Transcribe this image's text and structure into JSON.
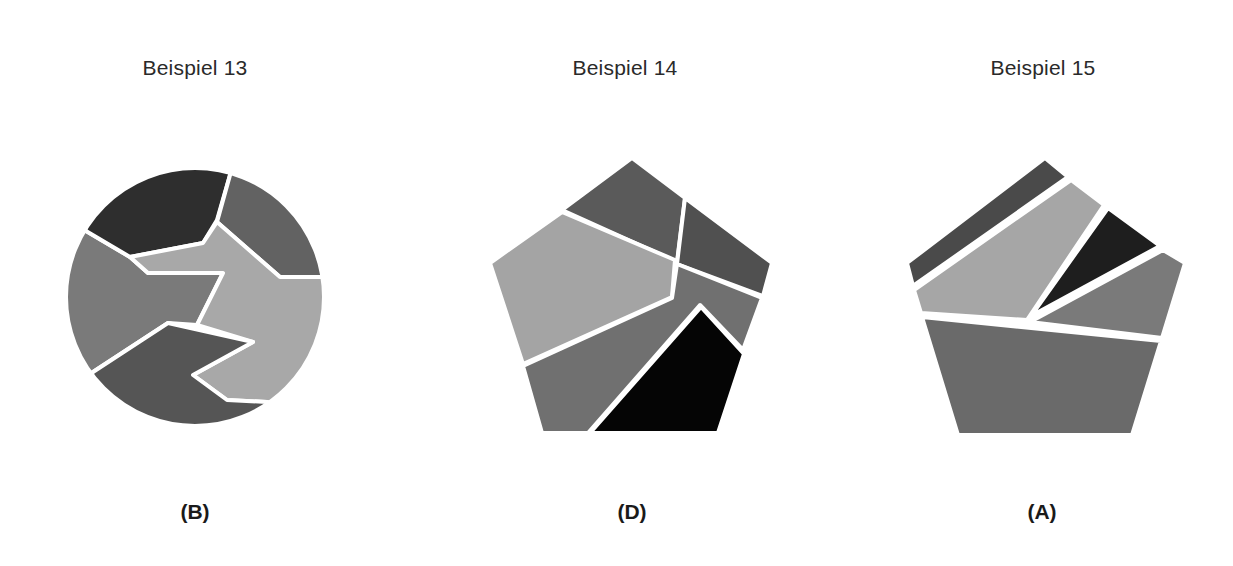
{
  "examples": [
    {
      "title": "Beispiel 13",
      "shape": "circle",
      "answer": "(B)",
      "pieces": 5
    },
    {
      "title": "Beispiel 14",
      "shape": "pentagon",
      "answer": "(D)",
      "pieces": 5
    },
    {
      "title": "Beispiel 15",
      "shape": "pentagon",
      "answer": "(A)",
      "pieces": 5
    }
  ],
  "colors": {
    "black": "#0a0a0a",
    "dark": "#3a3a3a",
    "medium_dark": "#5e5e5e",
    "medium": "#707070",
    "light": "#a6a6a6",
    "outline": "#ffffff"
  }
}
